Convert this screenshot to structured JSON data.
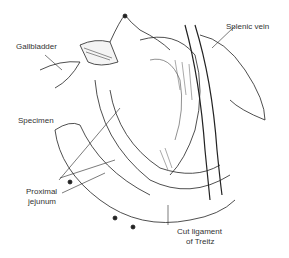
{
  "figure": {
    "type": "surgical illustration",
    "labels": {
      "gallbladder": "Gallbladder",
      "splenic_vein": "Splenic vein",
      "specimen": "Specimen",
      "proximal_jejunum_line1": "Proximal",
      "proximal_jejunum_line2": "jejunum",
      "cut_ligament_line1": "Cut ligament",
      "cut_ligament_line2": "of Treitz"
    }
  }
}
